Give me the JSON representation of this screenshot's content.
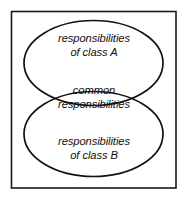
{
  "diagram": {
    "type": "venn-diagram",
    "frame": {
      "shape": "rectangle",
      "stroke_color": "#1a1a1a",
      "fill_color": "#ffffff"
    },
    "background_color": "#ffffff",
    "stroke_color": "#111111",
    "sets": [
      {
        "id": "class-a",
        "position": "upper",
        "shape": "ellipse",
        "lines": [
          "responsibilities",
          "of class A"
        ]
      },
      {
        "id": "common",
        "position": "intersection",
        "shape": "lens",
        "lines": [
          "common",
          "responsibilities"
        ]
      },
      {
        "id": "class-b",
        "position": "lower",
        "shape": "ellipse",
        "lines": [
          "responsibilities",
          "of class B"
        ]
      }
    ]
  }
}
